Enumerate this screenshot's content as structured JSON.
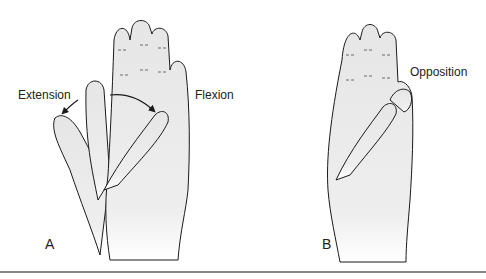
{
  "figure": {
    "panels": [
      {
        "id": "A",
        "label": "A",
        "annotations": [
          "Extension",
          "Flexion"
        ],
        "description": "Palm view of hand showing thumb extension and flexion"
      },
      {
        "id": "B",
        "label": "B",
        "annotations": [
          "Opposition"
        ],
        "description": "Palm view of hand showing thumb opposition to little finger"
      }
    ],
    "colors": {
      "skin": "#ececec",
      "outline": "#1a1a1a",
      "rule": "#888888"
    }
  }
}
